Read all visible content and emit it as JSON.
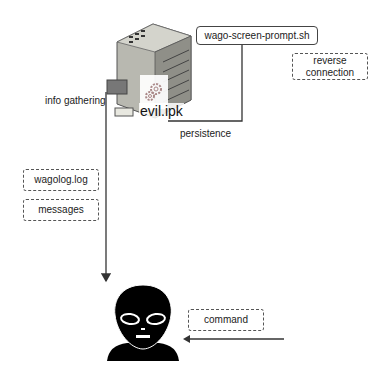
{
  "diagram": {
    "nodes": {
      "device": {
        "label": "evil.ipk",
        "icon": "plc-controller-icon"
      },
      "script": {
        "label": "wago-screen-prompt.sh"
      },
      "attacker": {
        "icon": "alien-icon"
      }
    },
    "edge_labels": {
      "info_gathering": "info gathering",
      "persistence": "persistence",
      "reverse_connection": "reverse\nconnection",
      "command": "command"
    },
    "artifacts": [
      {
        "label": "wagolog.log"
      },
      {
        "label": "messages"
      }
    ],
    "colors": {
      "line": "#333333",
      "dash": "#555555",
      "alien": "#000000"
    }
  }
}
